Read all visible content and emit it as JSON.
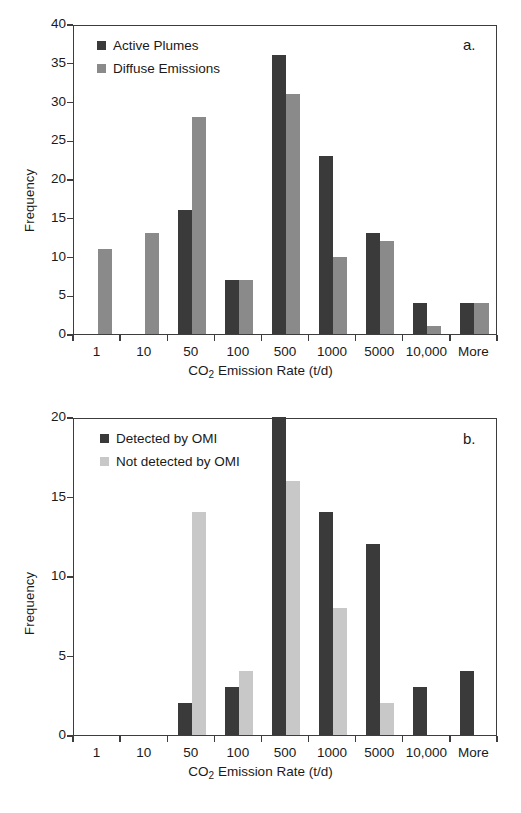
{
  "figure": {
    "background": "#ffffff",
    "axis_color": "#3d3d3d",
    "text_color": "#1a1a1a"
  },
  "panels": [
    {
      "id": "a",
      "letter": "a.",
      "ylabel": "Frequency",
      "xlabel_html": "CO<sub>2</sub> Emission Rate (t/d)",
      "xlabel": "CO2 Emission Rate (t/d)",
      "legend": [
        {
          "label": "Active Plumes",
          "color": "#3a3a3a"
        },
        {
          "label": "Diffuse Emissions",
          "color": "#8a8a8a"
        }
      ],
      "yticks": [
        "0",
        "5",
        "10",
        "15",
        "20",
        "25",
        "30",
        "35",
        "40"
      ],
      "xticks": [
        "1",
        "10",
        "50",
        "100",
        "500",
        "1000",
        "5000",
        "10,000",
        "More"
      ]
    },
    {
      "id": "b",
      "letter": "b.",
      "ylabel": "Frequency",
      "xlabel_html": "CO<sub>2</sub> Emission Rate (t/d)",
      "xlabel": "CO2 Emission Rate (t/d)",
      "legend": [
        {
          "label": "Detected by OMI",
          "color": "#3a3a3a"
        },
        {
          "label": "Not detected by OMI",
          "color": "#c8c8c8"
        }
      ],
      "yticks": [
        "0",
        "5",
        "10",
        "15",
        "20"
      ],
      "xticks": [
        "1",
        "10",
        "50",
        "100",
        "500",
        "1000",
        "5000",
        "10,000",
        "More"
      ]
    }
  ],
  "chart_data": [
    {
      "type": "bar",
      "title": "",
      "panel": "a",
      "categories": [
        "1",
        "10",
        "50",
        "100",
        "500",
        "1000",
        "5000",
        "10,000",
        "More"
      ],
      "series": [
        {
          "name": "Active Plumes",
          "color": "#3a3a3a",
          "values": [
            0,
            0,
            16,
            7,
            36,
            23,
            13,
            4,
            4
          ]
        },
        {
          "name": "Diffuse Emissions",
          "color": "#8a8a8a",
          "values": [
            11,
            13,
            28,
            7,
            31,
            10,
            12,
            1,
            4
          ]
        }
      ],
      "xlabel": "CO2 Emission Rate (t/d)",
      "ylabel": "Frequency",
      "ylim": [
        0,
        40
      ],
      "ytick_step": 5,
      "grid": false,
      "legend_position": "top-left",
      "annotations": [
        "a."
      ]
    },
    {
      "type": "bar",
      "title": "",
      "panel": "b",
      "categories": [
        "1",
        "10",
        "50",
        "100",
        "500",
        "1000",
        "5000",
        "10,000",
        "More"
      ],
      "series": [
        {
          "name": "Detected by OMI",
          "color": "#3a3a3a",
          "values": [
            0,
            0,
            2,
            3,
            20,
            14,
            12,
            3,
            4
          ]
        },
        {
          "name": "Not detected by OMI",
          "color": "#c8c8c8",
          "values": [
            0,
            0,
            14,
            4,
            16,
            8,
            2,
            0,
            0
          ]
        }
      ],
      "xlabel": "CO2 Emission Rate (t/d)",
      "ylabel": "Frequency",
      "ylim": [
        0,
        20
      ],
      "ytick_step": 5,
      "grid": false,
      "legend_position": "top-left",
      "annotations": [
        "b."
      ]
    }
  ]
}
